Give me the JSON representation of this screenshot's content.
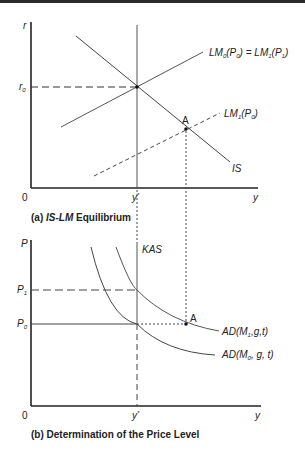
{
  "figure": {
    "panel_a": {
      "caption_prefix": "(a) ",
      "caption_italic": "IS-LM",
      "caption_suffix": " Equilibrium",
      "y_axis_label": "r",
      "x_axis_label": "y",
      "origin_label": "0",
      "r0_label": "r",
      "r0_sub": "0",
      "ystar_label": "y",
      "ystar_sup": "*",
      "point_label": "A",
      "is_label": "IS",
      "lm0_label": {
        "a": "LM",
        "a_sub": "0",
        "b": "(P",
        "b_sub": "0",
        "c": ") = ",
        "d": "LM",
        "d_sub": "1",
        "e": "(P",
        "e_sub": "1",
        "f": ")"
      },
      "lm1_label": {
        "a": "LM",
        "a_sub": "1",
        "b": "(P",
        "b_sub": "0",
        "c": ")"
      }
    },
    "panel_b": {
      "caption": "(b) Determination of the Price Level",
      "y_axis_label": "P",
      "x_axis_label": "y",
      "origin_label": "0",
      "p1_label": "P",
      "p1_sub": "1",
      "p0_label": "P",
      "p0_sub": "0",
      "ystar_label": "y",
      "ystar_sup": "*",
      "kas_label": "KAS",
      "point_label": "A",
      "ad1_label": {
        "a": "AD(M",
        "a_sub": "1",
        "b": ",g,t)"
      },
      "ad0_label": {
        "a": "AD(M",
        "a_sub": "0",
        "b": ", g, t)"
      }
    },
    "colors": {
      "ink": "#222222",
      "line": "#444444"
    }
  }
}
